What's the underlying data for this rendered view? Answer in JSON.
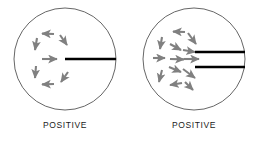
{
  "figure": {
    "background_color": "#ffffff",
    "panels": [
      {
        "id": "left-panel",
        "caption": "POSITIVE",
        "circle": {
          "cx": 65,
          "cy": 59,
          "r": 51,
          "stroke_color": "#555555",
          "stroke_width": 0.9,
          "fill": "none"
        },
        "bars": [
          {
            "x1": 65,
            "y1": 59,
            "x2": 116,
            "y2": 59,
            "color": "#000000",
            "width": 2.6
          }
        ],
        "arrows": {
          "color": "#808080",
          "count": 8,
          "pattern": "ring-clockwise",
          "items": [
            {
              "cx": 48,
              "cy": 34,
              "angle": 180,
              "len": 13
            },
            {
              "cx": 64,
              "cy": 40,
              "angle": 125,
              "len": 12
            },
            {
              "cx": 36,
              "cy": 44,
              "angle": 260,
              "len": 12
            },
            {
              "cx": 49,
              "cy": 59,
              "angle": 0,
              "len": 15
            },
            {
              "cx": 36,
              "cy": 72,
              "angle": 275,
              "len": 12
            },
            {
              "cx": 64,
              "cy": 77,
              "angle": 55,
              "len": 12
            },
            {
              "cx": 48,
              "cy": 84,
              "angle": 182,
              "len": 13
            }
          ]
        }
      },
      {
        "id": "right-panel",
        "caption": "POSITIVE",
        "circle": {
          "cx": 65,
          "cy": 59,
          "r": 51,
          "stroke_color": "#555555",
          "stroke_width": 0.9,
          "fill": "none"
        },
        "bars": [
          {
            "x1": 66,
            "y1": 52,
            "x2": 116,
            "y2": 52,
            "color": "#000000",
            "width": 2.6
          },
          {
            "x1": 66,
            "y1": 67,
            "x2": 116,
            "y2": 67,
            "color": "#000000",
            "width": 2.6
          }
        ],
        "arrows": {
          "color": "#808080",
          "count": 14,
          "pattern": "converging-inward",
          "items": [
            {
              "cx": 50,
              "cy": 32,
              "angle": 178,
              "len": 13
            },
            {
              "cx": 64,
              "cy": 38,
              "angle": 120,
              "len": 12
            },
            {
              "cx": 32,
              "cy": 42,
              "angle": 262,
              "len": 12
            },
            {
              "cx": 46,
              "cy": 48,
              "angle": 330,
              "len": 12
            },
            {
              "cx": 60,
              "cy": 52,
              "angle": 350,
              "len": 14
            },
            {
              "cx": 30,
              "cy": 58,
              "angle": 0,
              "len": 13
            },
            {
              "cx": 48,
              "cy": 59,
              "angle": 2,
              "len": 14
            },
            {
              "cx": 62,
              "cy": 59,
              "angle": 0,
              "len": 16
            },
            {
              "cx": 46,
              "cy": 70,
              "angle": 28,
              "len": 12
            },
            {
              "cx": 60,
              "cy": 74,
              "angle": 50,
              "len": 12
            },
            {
              "cx": 31,
              "cy": 76,
              "angle": 282,
              "len": 12
            },
            {
              "cx": 47,
              "cy": 84,
              "angle": 160,
              "len": 13
            },
            {
              "cx": 60,
              "cy": 86,
              "angle": 60,
              "len": 11
            }
          ]
        }
      }
    ]
  }
}
